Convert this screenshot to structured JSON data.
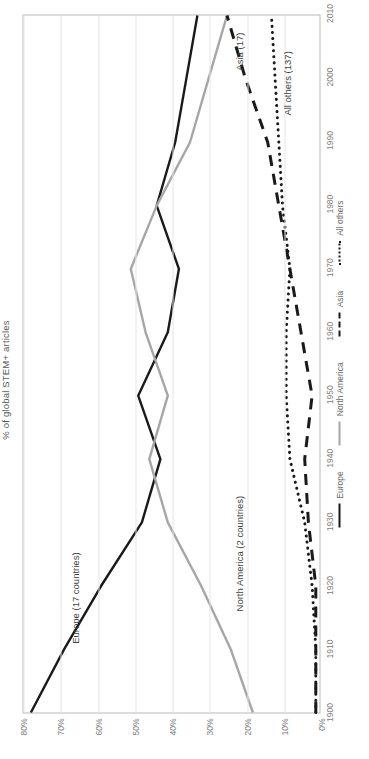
{
  "chart_data": {
    "type": "line",
    "title": "",
    "xlabel": "",
    "ylabel": "% of global STEM+ articles",
    "xlim": [
      1900,
      2010
    ],
    "ylim": [
      0,
      80
    ],
    "grid": true,
    "orientation": "rotated-90",
    "legend_position": "bottom",
    "y_ticks": [
      "0%",
      "10%",
      "20%",
      "30%",
      "40%",
      "50%",
      "60%",
      "70%",
      "80%"
    ],
    "y_tick_values": [
      0,
      10,
      20,
      30,
      40,
      50,
      60,
      70,
      80
    ],
    "x_ticks": [
      "1900",
      "1910",
      "1920",
      "1930",
      "1940",
      "1950",
      "1960",
      "1970",
      "1980",
      "1990",
      "2000",
      "2010"
    ],
    "x": [
      1900,
      1910,
      1920,
      1930,
      1940,
      1950,
      1960,
      1970,
      1980,
      1990,
      2000,
      2010
    ],
    "series": [
      {
        "name": "Europe",
        "annotation": "Europe (17 countries)",
        "color": "#1a1a1a",
        "style": "solid",
        "values": [
          78,
          69,
          59,
          48,
          43,
          49,
          41,
          38,
          44,
          39,
          36,
          33
        ]
      },
      {
        "name": "North America",
        "annotation": "North America (2 countries)",
        "color": "#a6a6a6",
        "style": "solid",
        "values": [
          18,
          24,
          32,
          41,
          46,
          41,
          47,
          51,
          44,
          35,
          30,
          25
        ]
      },
      {
        "name": "Asia",
        "annotation": "Asia (17)",
        "color": "#1a1a1a",
        "style": "dashed",
        "values": [
          1,
          1,
          1,
          3,
          4,
          2,
          5,
          8,
          11,
          14,
          20,
          25
        ]
      },
      {
        "name": "All others",
        "annotation": "All others (137)",
        "color": "#1a1a1a",
        "style": "dotted",
        "values": [
          1,
          1,
          2,
          4,
          8,
          9,
          9,
          8,
          10,
          11,
          12,
          13
        ]
      }
    ],
    "legend": [
      {
        "label": "Europe",
        "style": "solid",
        "color": "#1a1a1a"
      },
      {
        "label": "North America",
        "style": "solid",
        "color": "#a6a6a6"
      },
      {
        "label": "Asia",
        "style": "dashed",
        "color": "#1a1a1a"
      },
      {
        "label": "All others",
        "style": "dotted",
        "color": "#1a1a1a"
      }
    ],
    "annotations": [
      {
        "text": "Europe (17 countries)",
        "x": 1918,
        "y": 66
      },
      {
        "text": "North America (2 countries)",
        "x": 1925,
        "y": 22
      },
      {
        "text": "Asia (17)",
        "x": 2004,
        "y": 22
      },
      {
        "text": "All others (137)",
        "x": 1999,
        "y": 9
      }
    ]
  }
}
